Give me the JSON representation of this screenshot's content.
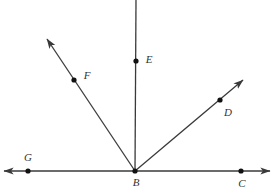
{
  "figure": {
    "background_color": "#ffffff",
    "line_color": "#3a3a3a",
    "dot_color": "#111111",
    "label_color": "#333333",
    "stroke_width": 1.3,
    "dot_radius": 2.6,
    "width": 274,
    "height": 191
  },
  "vertex": {
    "name": "B",
    "label": "B",
    "x": 135,
    "y": 171,
    "label_x": 136,
    "label_y": 183
  },
  "points": [
    {
      "id": "G",
      "label": "G",
      "x": 28,
      "y": 171,
      "label_x": 28,
      "label_y": 158,
      "on_ray": "ray-BG"
    },
    {
      "id": "F",
      "label": "F",
      "x": 74,
      "y": 80,
      "label_x": 87,
      "label_y": 76,
      "on_ray": "ray-BF"
    },
    {
      "id": "E",
      "label": "E",
      "x": 136,
      "y": 61,
      "label_x": 149,
      "label_y": 60,
      "on_ray": "ray-BE"
    },
    {
      "id": "D",
      "label": "D",
      "x": 220,
      "y": 100,
      "label_x": 228,
      "label_y": 113,
      "on_ray": "ray-BD"
    },
    {
      "id": "C",
      "label": "C",
      "x": 241,
      "y": 171,
      "label_x": 242,
      "label_y": 184,
      "on_ray": "ray-BC"
    }
  ],
  "rays": [
    {
      "id": "ray-BG",
      "name": "ray-b-to-g-left",
      "from_x": 135,
      "from_y": 171,
      "to_x": 4,
      "to_y": 171,
      "arrow": true,
      "through": "G"
    },
    {
      "id": "ray-BC",
      "name": "ray-b-to-c-right",
      "from_x": 135,
      "from_y": 171,
      "to_x": 270,
      "to_y": 171,
      "arrow": true,
      "through": "C"
    },
    {
      "id": "ray-BF",
      "name": "ray-b-to-f-upper-left",
      "from_x": 135,
      "from_y": 171,
      "to_x": 47,
      "to_y": 39,
      "arrow": true,
      "through": "F"
    },
    {
      "id": "ray-BE",
      "name": "ray-b-to-e-vertical",
      "from_x": 135,
      "from_y": 171,
      "to_x": 136,
      "to_y": 0,
      "arrow": false,
      "through": "E"
    },
    {
      "id": "ray-BD",
      "name": "ray-b-to-d-upper-right",
      "from_x": 135,
      "from_y": 171,
      "to_x": 243,
      "to_y": 80,
      "arrow": true,
      "through": "D"
    }
  ]
}
